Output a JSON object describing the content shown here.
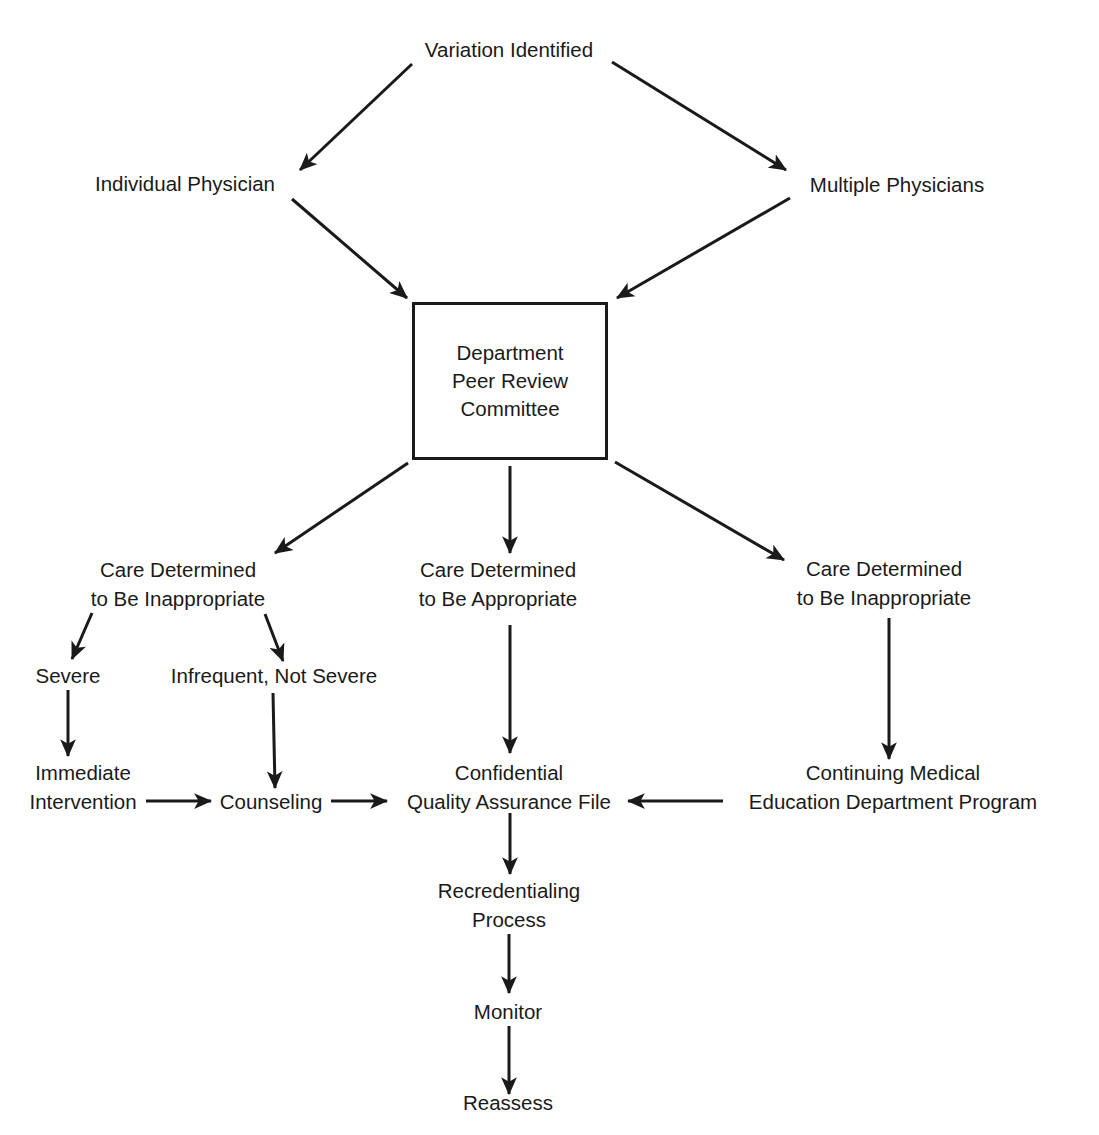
{
  "diagram": {
    "type": "flowchart",
    "colors": {
      "ink": "#1a1a1a",
      "background": "#ffffff"
    },
    "nodes": {
      "variation": {
        "lines": [
          "Variation Identified"
        ]
      },
      "individual": {
        "lines": [
          "Individual Physician"
        ]
      },
      "multiple": {
        "lines": [
          "Multiple Physicians"
        ]
      },
      "committee": {
        "lines": [
          "Department",
          "Peer Review",
          "Committee"
        ],
        "shape": "box"
      },
      "inappropriate_left": {
        "lines": [
          "Care Determined",
          "to Be Inappropriate"
        ]
      },
      "appropriate": {
        "lines": [
          "Care Determined",
          "to Be Appropriate"
        ]
      },
      "inappropriate_right": {
        "lines": [
          "Care Determined",
          "to Be Inappropriate"
        ]
      },
      "severe": {
        "lines": [
          "Severe"
        ]
      },
      "infrequent": {
        "lines": [
          "Infrequent, Not Severe"
        ]
      },
      "immediate": {
        "lines": [
          "Immediate",
          "Intervention"
        ]
      },
      "counseling": {
        "lines": [
          "Counseling"
        ]
      },
      "qa_file": {
        "lines": [
          "Confidential",
          "Quality Assurance File"
        ]
      },
      "cme": {
        "lines": [
          "Continuing Medical",
          "Education Department Program"
        ]
      },
      "recredentialing": {
        "lines": [
          "Recredentialing",
          "Process"
        ]
      },
      "monitor": {
        "lines": [
          "Monitor"
        ]
      },
      "reassess": {
        "lines": [
          "Reassess"
        ]
      }
    },
    "edges": [
      {
        "from": "variation",
        "to": "individual"
      },
      {
        "from": "variation",
        "to": "multiple"
      },
      {
        "from": "individual",
        "to": "committee"
      },
      {
        "from": "multiple",
        "to": "committee"
      },
      {
        "from": "committee",
        "to": "inappropriate_left"
      },
      {
        "from": "committee",
        "to": "appropriate"
      },
      {
        "from": "committee",
        "to": "inappropriate_right"
      },
      {
        "from": "inappropriate_left",
        "to": "severe"
      },
      {
        "from": "inappropriate_left",
        "to": "infrequent"
      },
      {
        "from": "severe",
        "to": "immediate"
      },
      {
        "from": "infrequent",
        "to": "counseling"
      },
      {
        "from": "immediate",
        "to": "counseling"
      },
      {
        "from": "counseling",
        "to": "qa_file"
      },
      {
        "from": "appropriate",
        "to": "qa_file"
      },
      {
        "from": "inappropriate_right",
        "to": "cme"
      },
      {
        "from": "cme",
        "to": "qa_file"
      },
      {
        "from": "qa_file",
        "to": "recredentialing"
      },
      {
        "from": "recredentialing",
        "to": "monitor"
      },
      {
        "from": "monitor",
        "to": "reassess"
      }
    ]
  }
}
